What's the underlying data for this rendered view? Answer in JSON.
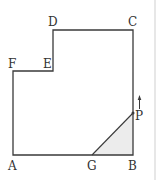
{
  "diagram": {
    "type": "geometry-figure",
    "colors": {
      "stroke": "#3a3a3a",
      "shade": "#ececec",
      "border": "#cfcfcf",
      "label": "#333333"
    },
    "points": {
      "A": {
        "label": "A",
        "x": 13,
        "y": 155
      },
      "B": {
        "label": "B",
        "x": 133,
        "y": 155
      },
      "C": {
        "label": "C",
        "x": 133,
        "y": 30
      },
      "D": {
        "label": "D",
        "x": 53,
        "y": 30
      },
      "E": {
        "label": "E",
        "x": 53,
        "y": 71
      },
      "F": {
        "label": "F",
        "x": 13,
        "y": 71
      },
      "G": {
        "label": "G",
        "x": 92,
        "y": 155
      },
      "P": {
        "label": "P",
        "x": 133,
        "y": 113
      }
    },
    "polygon": "A-B-C-D-E-F",
    "segments": [
      "G-P"
    ],
    "shaded_region": "G-B-P",
    "arrow": {
      "near": "P",
      "direction": "up",
      "meaning": "P moves upward along BC"
    }
  }
}
